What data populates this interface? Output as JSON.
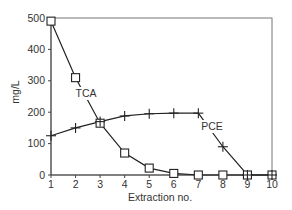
{
  "chart_data": {
    "type": "line",
    "title": "",
    "xlabel": "Extraction no.",
    "ylabel": "mg/L",
    "x": [
      1,
      2,
      3,
      4,
      5,
      6,
      7,
      8,
      9,
      10
    ],
    "xlim": [
      1,
      10
    ],
    "ylim": [
      0,
      500
    ],
    "xticks": [
      1,
      2,
      3,
      4,
      5,
      6,
      7,
      8,
      9,
      10
    ],
    "yticks": [
      0,
      100,
      200,
      300,
      400,
      500
    ],
    "grid": false,
    "legend": "inline annotations",
    "series": [
      {
        "name": "TCA",
        "marker": "square",
        "values": [
          490,
          310,
          165,
          70,
          22,
          5,
          0,
          0,
          0,
          0
        ]
      },
      {
        "name": "PCE",
        "marker": "plus",
        "values": [
          125,
          150,
          170,
          188,
          195,
          197,
          197,
          90,
          0,
          0
        ]
      }
    ],
    "annotations": [
      {
        "text": "TCA",
        "near_x": 2.5,
        "near_y": 255
      },
      {
        "text": "PCE",
        "near_x": 7.5,
        "near_y": 150
      }
    ]
  }
}
